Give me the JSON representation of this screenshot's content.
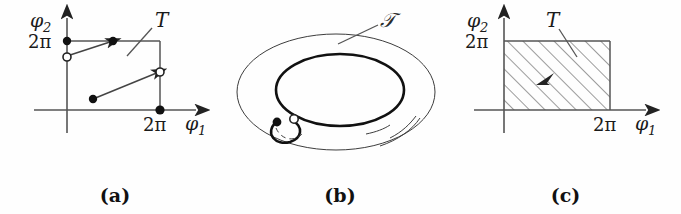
{
  "figure": {
    "kind": "three-panel mathematical diagram",
    "background_color": "#fefefe",
    "ink_color": "#1a1a1a"
  },
  "panels": [
    {
      "id": "a",
      "caption": "(a)",
      "axes": {
        "x_label": "φ",
        "x_label_sub": "1",
        "y_label": "φ",
        "y_label_sub": "2",
        "x_tick_label": "2π",
        "y_tick_label": "2π"
      },
      "region_label": "T",
      "markers": [
        {
          "name": "origin-corner-top-left-filled",
          "type": "filled"
        },
        {
          "name": "upper-segment-end-filled",
          "type": "filled"
        },
        {
          "name": "left-edge-open",
          "type": "open"
        },
        {
          "name": "right-edge-open",
          "type": "open"
        },
        {
          "name": "lower-segment-start-filled",
          "type": "filled"
        },
        {
          "name": "x-tick-filled",
          "type": "filled"
        }
      ],
      "trajectory_segments": 2
    },
    {
      "id": "b",
      "caption": "(b)",
      "region_label": "𝒯",
      "shape": "torus",
      "markers": [
        {
          "name": "loop-start-filled",
          "type": "filled"
        },
        {
          "name": "loop-end-open",
          "type": "open"
        }
      ]
    },
    {
      "id": "c",
      "caption": "(c)",
      "axes": {
        "x_label": "φ",
        "x_label_sub": "1",
        "y_label": "φ",
        "y_label_sub": "2",
        "x_tick_label": "2π",
        "y_tick_label": "2π"
      },
      "region_label": "T",
      "fill": "diagonal-hatching",
      "hatch_angle_deg": 45,
      "flow_arrow": "up-right"
    }
  ]
}
